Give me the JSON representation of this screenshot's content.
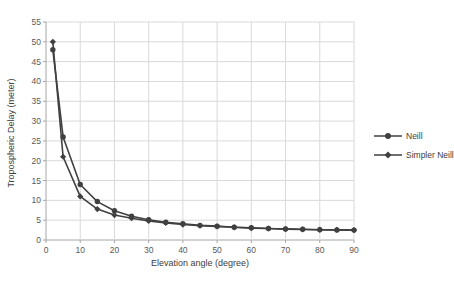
{
  "colors": {
    "series": "#404040",
    "grid": "#d9d9d9",
    "axis": "#a6a6a6",
    "tick_text": "#595959",
    "background": "#ffffff"
  },
  "chart_data": {
    "type": "line",
    "title": "",
    "xlabel": "Elevation angle (degree)",
    "ylabel": "Tropospheric Delay (meter)",
    "xlim": [
      0,
      90
    ],
    "ylim": [
      0,
      55
    ],
    "x_ticks": [
      0,
      10,
      20,
      30,
      40,
      50,
      60,
      70,
      80,
      90
    ],
    "y_ticks": [
      0,
      5,
      10,
      15,
      20,
      25,
      30,
      35,
      40,
      45,
      50,
      55
    ],
    "grid": true,
    "legend_position": "right",
    "x": [
      2,
      5,
      10,
      15,
      20,
      25,
      30,
      35,
      40,
      45,
      50,
      55,
      60,
      65,
      70,
      75,
      80,
      85,
      90
    ],
    "series": [
      {
        "name": "Neill",
        "marker": "circle",
        "color": "#404040",
        "values": [
          48,
          26,
          14,
          9.7,
          7.4,
          6.0,
          5.1,
          4.5,
          4.1,
          3.7,
          3.5,
          3.2,
          3.1,
          2.9,
          2.8,
          2.7,
          2.6,
          2.55,
          2.5
        ]
      },
      {
        "name": "Simpler Neill",
        "marker": "diamond",
        "color": "#404040",
        "values": [
          50,
          21,
          11,
          7.8,
          6.3,
          5.5,
          4.8,
          4.3,
          3.9,
          3.6,
          3.4,
          3.2,
          3.0,
          2.9,
          2.75,
          2.65,
          2.6,
          2.55,
          2.5
        ]
      }
    ]
  }
}
